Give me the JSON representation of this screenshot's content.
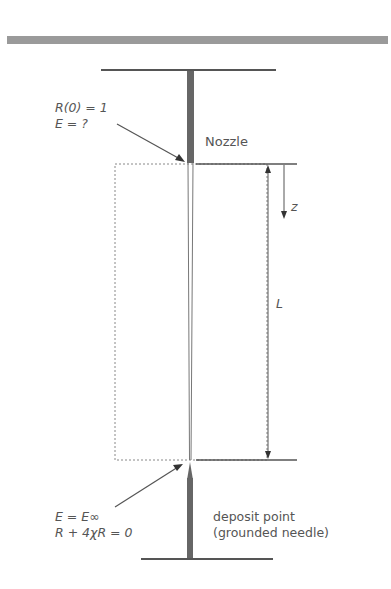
{
  "diagram": {
    "labels": {
      "nozzle": "Nozzle",
      "top_condition_line1": "R(0) = 1",
      "top_condition_line2": "E = ?",
      "z_axis": "z",
      "length": "L",
      "bottom_condition_line1": "E = E∞",
      "bottom_condition_line2": "R + 4χR = 0",
      "deposit_line1": "deposit point",
      "deposit_line2": "(grounded needle)"
    },
    "colors": {
      "band": "#9a9a9a",
      "line": "#555555",
      "needle": "#666666",
      "dotted": "#888888"
    }
  }
}
